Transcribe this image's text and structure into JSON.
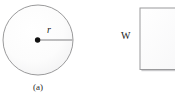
{
  "figure": {
    "background_color": "#ffffff",
    "panels": [
      {
        "id": "panel-a",
        "caption": "(a)",
        "shape": "circle",
        "shape_name": "circle-with-radius",
        "center_x": 38,
        "center_y": 40,
        "radius": 35,
        "outline_color": "#8e8e90",
        "fill_color": "#fdfdfd",
        "center_dot_color": "#111111",
        "center_dot_radius": 2.6,
        "radius_line_color": "#a8a8aa",
        "radius_label": "r",
        "radius_label_style": "italic"
      },
      {
        "id": "panel-b",
        "caption": "",
        "shape": "rectangle",
        "shape_name": "rectangle-with-width",
        "left": 140,
        "top": 8,
        "right": 186,
        "bottom": 70,
        "outline_color": "#9a9a9c",
        "fill_color": "#fefefe",
        "shadow_color": "#c9c9cb",
        "width_label": "W",
        "cropped_right_edge": true
      }
    ]
  }
}
